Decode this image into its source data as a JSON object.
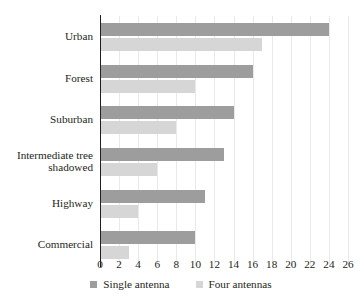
{
  "chart_data": {
    "type": "bar",
    "orientation": "horizontal",
    "title": "",
    "subtitle": "",
    "xlabel": "",
    "ylabel": "",
    "xlim": [
      0,
      26
    ],
    "xticks": [
      0,
      2,
      4,
      6,
      8,
      10,
      12,
      14,
      16,
      18,
      20,
      22,
      24,
      26
    ],
    "xtick_labels": [
      "0",
      "2",
      "4",
      "6",
      "8",
      "10",
      "12",
      "14",
      "16",
      "18",
      "20",
      "22",
      "24",
      "26"
    ],
    "grid": true,
    "grid_axis": "x",
    "legend_position": "bottom",
    "categories": [
      "Urban",
      "Forest",
      "Suburban",
      "Intermediate tree\nshadowed",
      "Highway",
      "Commercial"
    ],
    "series": [
      {
        "name": "Single antenna",
        "color": "#9d9d9d",
        "values": [
          24,
          16,
          14,
          13,
          11,
          10
        ]
      },
      {
        "name": "Four antennas",
        "color": "#d6d6d6",
        "values": [
          17,
          10,
          8,
          6,
          4,
          3
        ]
      }
    ]
  },
  "legend": {
    "items": [
      {
        "label": "Single antenna",
        "swatch": "single"
      },
      {
        "label": "Four antennas",
        "swatch": "four"
      }
    ]
  },
  "colors": {
    "series_single": "#9d9d9d",
    "series_four": "#d6d6d6",
    "axis": "#231f20",
    "gridline": "#e9e9e9",
    "background": "#ffffff",
    "text": "#231f20"
  }
}
